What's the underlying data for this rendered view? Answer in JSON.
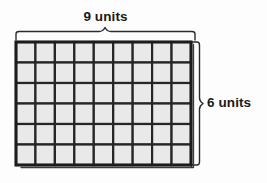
{
  "figure": {
    "type": "area-model-rectangle-grid",
    "title": "",
    "width_label": "9 units",
    "height_label": "6 units",
    "columns": 9,
    "rows": 6,
    "total_cells": 54,
    "colors": {
      "background": "#fdfdfd",
      "cell_fill": "#e9e9e9",
      "grid_line": "#262626",
      "outline": "#1c1c1c",
      "brace": "#2b2b2b",
      "text": "#1a1a1a"
    },
    "braces": {
      "top": {
        "label": "9 units",
        "position": "above",
        "direction": "up"
      },
      "right": {
        "label": "6 units",
        "position": "right",
        "direction": "right"
      }
    }
  },
  "chart_data": {
    "type": "table",
    "xlabel": "9 units",
    "ylabel": "6 units",
    "categories": [
      "columns",
      "rows"
    ],
    "values": [
      9,
      6
    ],
    "annotations": [
      "9 units",
      "6 units"
    ]
  }
}
